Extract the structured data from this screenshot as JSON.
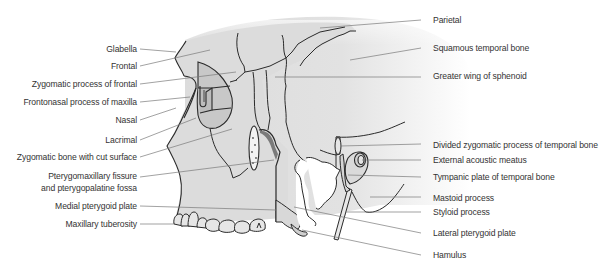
{
  "diagram": {
    "colors": {
      "bone_fill": "#dcdcdc",
      "orbit_fill": "#c4c4c4",
      "outline": "#2a2a2a",
      "leader_line": "#7a7a7a",
      "label_text": "#333333",
      "background": "#ffffff"
    },
    "labels_left": [
      {
        "id": "glabella",
        "text": "Glabella"
      },
      {
        "id": "frontal",
        "text": "Frontal"
      },
      {
        "id": "zygomatic-process-of-frontal",
        "text": "Zygomatic process of frontal"
      },
      {
        "id": "frontonasal-process-of-maxilla",
        "text": "Frontonasal process of maxilla"
      },
      {
        "id": "nasal",
        "text": "Nasal"
      },
      {
        "id": "lacrimal",
        "text": "Lacrimal"
      },
      {
        "id": "zygomatic-bone-cut-surface",
        "text": "Zygomatic bone with cut surface"
      },
      {
        "id": "pterygomaxillary-fissure-line1",
        "text": "Pterygomaxillary fissure"
      },
      {
        "id": "pterygomaxillary-fissure-line2",
        "text": "and pterygopalatine fossa"
      },
      {
        "id": "medial-pterygoid-plate",
        "text": "Medial pterygoid plate"
      },
      {
        "id": "maxillary-tuberosity",
        "text": "Maxillary tuberosity"
      }
    ],
    "labels_right": [
      {
        "id": "parietal",
        "text": "Parietal"
      },
      {
        "id": "squamous-temporal-bone",
        "text": "Squamous temporal bone"
      },
      {
        "id": "greater-wing-of-sphenoid",
        "text": "Greater wing of sphenoid"
      },
      {
        "id": "divided-zygomatic-process",
        "text": "Divided zygomatic process of temporal bone"
      },
      {
        "id": "external-acoustic-meatus",
        "text": "External acoustic meatus"
      },
      {
        "id": "tympanic-plate",
        "text": "Tympanic plate of temporal bone"
      },
      {
        "id": "mastoid-process",
        "text": "Mastoid process"
      },
      {
        "id": "styloid-process",
        "text": "Styloid process"
      },
      {
        "id": "lateral-pterygoid-plate",
        "text": "Lateral pterygoid plate"
      },
      {
        "id": "hamulus",
        "text": "Hamulus"
      }
    ]
  }
}
